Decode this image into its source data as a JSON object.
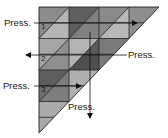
{
  "diagram": {
    "type": "folding-instruction",
    "shape": "right-triangle-grid",
    "colors": {
      "grid_line": "#222222",
      "shade_light": "#b8b8b8",
      "shade_mid": "#8c8c8c",
      "shade_dark": "#6a6a6a",
      "shade_darker": "#555555",
      "arrow": "#111111"
    },
    "steps": [
      {
        "number": "1",
        "label": "Press.",
        "direction": "right"
      },
      {
        "number": "2",
        "label": "Press.",
        "direction": "left"
      },
      {
        "number": "3",
        "label": "Press.",
        "direction": "right"
      },
      {
        "number": "",
        "label": "Press.",
        "direction": "down"
      }
    ]
  }
}
